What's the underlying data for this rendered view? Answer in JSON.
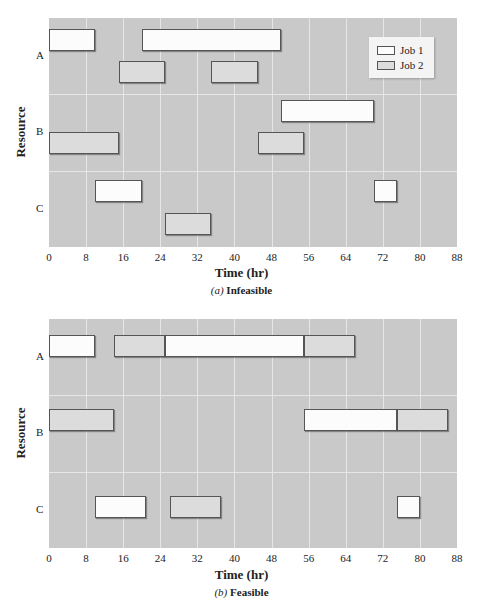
{
  "chart_data": [
    {
      "type": "gantt",
      "title": "(a) Infeasible",
      "caption_prefix": "(a)",
      "caption_text": "Infeasible",
      "xlabel": "Time (hr)",
      "ylabel": "Resource",
      "xlim": [
        0,
        88
      ],
      "xticks": [
        0,
        8,
        16,
        24,
        32,
        40,
        48,
        56,
        64,
        72,
        80,
        88
      ],
      "resources": [
        "A",
        "B",
        "C"
      ],
      "grid": true,
      "legend": [
        "Job 1",
        "Job 2"
      ],
      "legend_position": "top-right",
      "tasks": [
        {
          "resource": "A",
          "job": "Job 1",
          "start": 0,
          "end": 10
        },
        {
          "resource": "A",
          "job": "Job 1",
          "start": 20,
          "end": 50
        },
        {
          "resource": "A",
          "job": "Job 2",
          "start": 15,
          "end": 25
        },
        {
          "resource": "A",
          "job": "Job 2",
          "start": 35,
          "end": 45
        },
        {
          "resource": "B",
          "job": "Job 1",
          "start": 50,
          "end": 70
        },
        {
          "resource": "B",
          "job": "Job 2",
          "start": 0,
          "end": 15
        },
        {
          "resource": "B",
          "job": "Job 2",
          "start": 45,
          "end": 55
        },
        {
          "resource": "C",
          "job": "Job 1",
          "start": 10,
          "end": 20
        },
        {
          "resource": "C",
          "job": "Job 1",
          "start": 70,
          "end": 75
        },
        {
          "resource": "C",
          "job": "Job 2",
          "start": 25,
          "end": 35
        }
      ]
    },
    {
      "type": "gantt",
      "title": "(b) Feasible",
      "caption_prefix": "(b)",
      "caption_text": "Feasible",
      "xlabel": "Time (hr)",
      "ylabel": "Resource",
      "xlim": [
        0,
        88
      ],
      "xticks": [
        0,
        8,
        16,
        24,
        32,
        40,
        48,
        56,
        64,
        72,
        80,
        88
      ],
      "resources": [
        "A",
        "B",
        "C"
      ],
      "grid": true,
      "tasks": [
        {
          "resource": "A",
          "job": "Job 1",
          "start": 0,
          "end": 10
        },
        {
          "resource": "A",
          "job": "Job 2",
          "start": 14,
          "end": 25
        },
        {
          "resource": "A",
          "job": "Job 1",
          "start": 25,
          "end": 55
        },
        {
          "resource": "A",
          "job": "Job 2",
          "start": 55,
          "end": 66
        },
        {
          "resource": "B",
          "job": "Job 2",
          "start": 0,
          "end": 14
        },
        {
          "resource": "B",
          "job": "Job 1",
          "start": 55,
          "end": 75
        },
        {
          "resource": "B",
          "job": "Job 2",
          "start": 75,
          "end": 86
        },
        {
          "resource": "C",
          "job": "Job 1",
          "start": 10,
          "end": 21
        },
        {
          "resource": "C",
          "job": "Job 2",
          "start": 26,
          "end": 37
        },
        {
          "resource": "C",
          "job": "Job 1",
          "start": 75,
          "end": 80
        }
      ]
    }
  ],
  "legend": {
    "job1": "Job 1",
    "job2": "Job 2"
  },
  "colors": {
    "plot_bg": "#c9c9c9",
    "grid": "#e6e6e6",
    "job1": "#fcfcfc",
    "job2": "#dcdcdc",
    "border": "#555555"
  }
}
